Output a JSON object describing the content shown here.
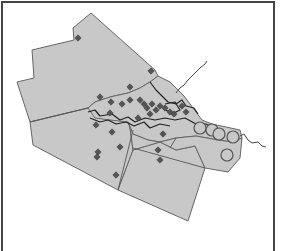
{
  "map": {
    "colors": {
      "region_fill": "#c8c8c8",
      "region_stroke": "#666666",
      "marker_fill": "#555555",
      "frame": "#444444",
      "background": "#ffffff"
    },
    "legend": null,
    "markers": {
      "diamonds": [
        [
          78,
          38
        ],
        [
          151,
          71
        ],
        [
          130,
          87
        ],
        [
          100,
          97
        ],
        [
          111,
          102
        ],
        [
          122,
          104
        ],
        [
          130,
          100
        ],
        [
          140,
          100
        ],
        [
          144,
          104
        ],
        [
          147,
          108
        ],
        [
          152,
          104
        ],
        [
          156,
          110
        ],
        [
          160,
          106
        ],
        [
          165,
          108
        ],
        [
          170,
          112
        ],
        [
          174,
          114
        ],
        [
          150,
          114
        ],
        [
          138,
          118
        ],
        [
          110,
          113
        ],
        [
          96,
          125
        ],
        [
          112,
          132
        ],
        [
          163,
          134
        ],
        [
          120,
          147
        ],
        [
          98,
          152
        ],
        [
          97,
          157
        ],
        [
          116,
          175
        ],
        [
          160,
          160
        ],
        [
          158,
          150
        ],
        [
          182,
          106
        ],
        [
          186,
          112
        ]
      ],
      "circles": [
        [
          200,
          128,
          6
        ],
        [
          212,
          130,
          6
        ],
        [
          219,
          134,
          6
        ],
        [
          233,
          137,
          6
        ],
        [
          227,
          155,
          6
        ]
      ]
    }
  }
}
